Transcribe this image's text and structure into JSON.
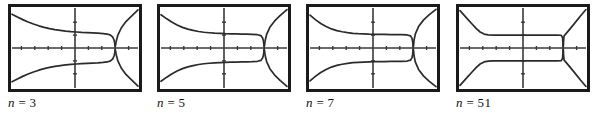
{
  "figure": {
    "caption_style": "italic-serif",
    "colors": {
      "frame": "#1a1a1a",
      "curve": "#2b2b2b",
      "axis": "#3a3a3a",
      "background": "#ffffff"
    },
    "panels": [
      {
        "id": "panel-n-3",
        "label_var": "n",
        "label_eq": "=",
        "label_value": "3",
        "label_text": "n = 3"
      },
      {
        "id": "panel-n-5",
        "label_var": "n",
        "label_eq": "=",
        "label_value": "5",
        "label_text": "n = 5"
      },
      {
        "id": "panel-n-7",
        "label_var": "n",
        "label_eq": "=",
        "label_value": "7",
        "label_text": "n = 7"
      },
      {
        "id": "panel-n-51",
        "label_var": "n",
        "label_eq": "=",
        "label_value": "51",
        "label_text": "n = 51"
      }
    ]
  },
  "chart_data": [
    {
      "type": "line",
      "title": "n = 3",
      "xlabel": "",
      "ylabel": "",
      "xlim": [
        -4.7,
        4.7
      ],
      "ylim": [
        -3.1,
        3.1
      ],
      "grid": false,
      "legend": false,
      "x_ticks": [
        -4,
        -3,
        -2,
        -1,
        1,
        2,
        3,
        4
      ],
      "y_ticks": [
        -2,
        -1,
        1,
        2
      ],
      "asymptote_x": 3.0,
      "series": [
        {
          "name": "upper-branch",
          "x": [
            -4.7,
            -4.3,
            -3.9,
            -3.5,
            -3.1,
            -2.7,
            -2.3,
            -1.9,
            -1.5,
            -1.1,
            -0.7,
            -0.3,
            0.1,
            0.5,
            0.9,
            1.3,
            1.7,
            2.1,
            2.4,
            2.65,
            2.82,
            2.92,
            2.97,
            2.99
          ],
          "y": [
            2.62,
            2.4,
            2.2,
            2.02,
            1.86,
            1.72,
            1.6,
            1.5,
            1.42,
            1.36,
            1.31,
            1.27,
            1.24,
            1.21,
            1.19,
            1.17,
            1.15,
            1.12,
            1.08,
            1.0,
            0.84,
            0.6,
            0.34,
            0.12
          ]
        },
        {
          "name": "lower-branch",
          "x": [
            -4.7,
            -4.3,
            -3.9,
            -3.5,
            -3.1,
            -2.7,
            -2.3,
            -1.9,
            -1.5,
            -1.1,
            -0.7,
            -0.3,
            0.1,
            0.5,
            0.9,
            1.3,
            1.7,
            2.1,
            2.4,
            2.65,
            2.82,
            2.92,
            2.97,
            2.99
          ],
          "y": [
            -2.62,
            -2.4,
            -2.2,
            -2.02,
            -1.86,
            -1.72,
            -1.6,
            -1.5,
            -1.42,
            -1.36,
            -1.31,
            -1.27,
            -1.24,
            -1.21,
            -1.19,
            -1.17,
            -1.15,
            -1.12,
            -1.08,
            -1.0,
            -0.84,
            -0.6,
            -0.34,
            -0.12
          ]
        },
        {
          "name": "right-upper-tail",
          "x": [
            3.02,
            3.08,
            3.2,
            3.45,
            3.8,
            4.2,
            4.7
          ],
          "y": [
            0.18,
            0.55,
            1.0,
            1.55,
            2.05,
            2.45,
            2.95
          ]
        },
        {
          "name": "right-lower-tail",
          "x": [
            3.02,
            3.08,
            3.2,
            3.45,
            3.8,
            4.2,
            4.7
          ],
          "y": [
            -0.18,
            -0.55,
            -1.0,
            -1.55,
            -2.05,
            -2.45,
            -2.95
          ]
        }
      ]
    },
    {
      "type": "line",
      "title": "n = 5",
      "xlabel": "",
      "ylabel": "",
      "xlim": [
        -4.7,
        4.7
      ],
      "ylim": [
        -3.1,
        3.1
      ],
      "grid": false,
      "legend": false,
      "x_ticks": [
        -4,
        -3,
        -2,
        -1,
        1,
        2,
        3,
        4
      ],
      "y_ticks": [
        -2,
        -1,
        1,
        2
      ],
      "asymptote_x": 3.0,
      "series": [
        {
          "name": "upper-branch",
          "x": [
            -4.7,
            -4.3,
            -3.9,
            -3.5,
            -3.1,
            -2.7,
            -2.3,
            -1.9,
            -1.5,
            -1.1,
            -0.7,
            -0.3,
            0.1,
            0.5,
            0.9,
            1.3,
            1.7,
            2.1,
            2.5,
            2.75,
            2.88,
            2.94,
            2.97,
            2.99
          ],
          "y": [
            2.58,
            2.28,
            2.01,
            1.78,
            1.6,
            1.46,
            1.36,
            1.28,
            1.22,
            1.18,
            1.15,
            1.13,
            1.11,
            1.1,
            1.09,
            1.08,
            1.07,
            1.06,
            1.03,
            0.96,
            0.78,
            0.55,
            0.32,
            0.11
          ]
        },
        {
          "name": "lower-branch",
          "x": [
            -4.7,
            -4.3,
            -3.9,
            -3.5,
            -3.1,
            -2.7,
            -2.3,
            -1.9,
            -1.5,
            -1.1,
            -0.7,
            -0.3,
            0.1,
            0.5,
            0.9,
            1.3,
            1.7,
            2.1,
            2.5,
            2.75,
            2.88,
            2.94,
            2.97,
            2.99
          ],
          "y": [
            -2.58,
            -2.28,
            -2.01,
            -1.78,
            -1.6,
            -1.46,
            -1.36,
            -1.28,
            -1.22,
            -1.18,
            -1.15,
            -1.13,
            -1.11,
            -1.1,
            -1.09,
            -1.08,
            -1.07,
            -1.06,
            -1.03,
            -0.96,
            -0.78,
            -0.55,
            -0.32,
            -0.11
          ]
        },
        {
          "name": "right-upper-tail",
          "x": [
            3.02,
            3.07,
            3.18,
            3.42,
            3.78,
            4.2,
            4.7
          ],
          "y": [
            0.16,
            0.58,
            1.05,
            1.6,
            2.1,
            2.52,
            2.98
          ]
        },
        {
          "name": "right-lower-tail",
          "x": [
            3.02,
            3.07,
            3.18,
            3.42,
            3.78,
            4.2,
            4.7
          ],
          "y": [
            -0.16,
            -0.58,
            -1.05,
            -1.6,
            -2.1,
            -2.52,
            -2.98
          ]
        }
      ]
    },
    {
      "type": "line",
      "title": "n = 7",
      "xlabel": "",
      "ylabel": "",
      "xlim": [
        -4.7,
        4.7
      ],
      "ylim": [
        -3.1,
        3.1
      ],
      "grid": false,
      "legend": false,
      "x_ticks": [
        -4,
        -3,
        -2,
        -1,
        1,
        2,
        3,
        4
      ],
      "y_ticks": [
        -2,
        -1,
        1,
        2
      ],
      "asymptote_x": 3.0,
      "series": [
        {
          "name": "upper-branch",
          "x": [
            -4.7,
            -4.3,
            -3.9,
            -3.5,
            -3.1,
            -2.7,
            -2.3,
            -1.9,
            -1.5,
            -1.1,
            -0.7,
            -0.3,
            0.1,
            0.5,
            0.9,
            1.3,
            1.7,
            2.1,
            2.55,
            2.8,
            2.91,
            2.96,
            2.98,
            2.99
          ],
          "y": [
            2.55,
            2.2,
            1.9,
            1.67,
            1.48,
            1.35,
            1.26,
            1.19,
            1.14,
            1.11,
            1.09,
            1.07,
            1.06,
            1.05,
            1.05,
            1.04,
            1.04,
            1.03,
            1.01,
            0.94,
            0.74,
            0.5,
            0.28,
            0.1
          ]
        },
        {
          "name": "lower-branch",
          "x": [
            -4.7,
            -4.3,
            -3.9,
            -3.5,
            -3.1,
            -2.7,
            -2.3,
            -1.9,
            -1.5,
            -1.1,
            -0.7,
            -0.3,
            0.1,
            0.5,
            0.9,
            1.3,
            1.7,
            2.1,
            2.55,
            2.8,
            2.91,
            2.96,
            2.98,
            2.99
          ],
          "y": [
            -2.55,
            -2.2,
            -1.9,
            -1.67,
            -1.48,
            -1.35,
            -1.26,
            -1.19,
            -1.14,
            -1.11,
            -1.09,
            -1.07,
            -1.06,
            -1.05,
            -1.05,
            -1.04,
            -1.04,
            -1.03,
            -1.01,
            -0.94,
            -0.74,
            -0.5,
            -0.28,
            -0.1
          ]
        },
        {
          "name": "right-upper-tail",
          "x": [
            3.02,
            3.06,
            3.16,
            3.4,
            3.76,
            4.2,
            4.7
          ],
          "y": [
            0.15,
            0.6,
            1.1,
            1.66,
            2.16,
            2.58,
            3.0
          ]
        },
        {
          "name": "right-lower-tail",
          "x": [
            3.02,
            3.06,
            3.16,
            3.4,
            3.76,
            4.2,
            4.7
          ],
          "y": [
            -0.15,
            -0.6,
            -1.1,
            -1.66,
            -2.16,
            -2.58,
            -3.0
          ]
        }
      ]
    },
    {
      "type": "line",
      "title": "n = 51",
      "xlabel": "",
      "ylabel": "",
      "xlim": [
        -4.7,
        4.7
      ],
      "ylim": [
        -3.1,
        3.1
      ],
      "grid": false,
      "legend": false,
      "x_ticks": [
        -4,
        -3,
        -2,
        -1,
        1,
        2,
        3,
        4
      ],
      "y_ticks": [
        -2,
        -1,
        1,
        2
      ],
      "asymptote_x": 3.0,
      "series": [
        {
          "name": "upper-branch",
          "x": [
            -4.7,
            -4.4,
            -4.1,
            -3.8,
            -3.5,
            -3.2,
            -2.9,
            -2.6,
            -2.2,
            -1.6,
            -1.0,
            -0.4,
            0.2,
            0.8,
            1.4,
            2.0,
            2.5,
            2.85,
            2.95,
            2.975,
            2.99
          ],
          "y": [
            2.9,
            2.55,
            2.2,
            1.86,
            1.52,
            1.24,
            1.08,
            1.02,
            1.0,
            1.0,
            1.0,
            1.0,
            1.0,
            1.0,
            1.0,
            1.0,
            1.0,
            0.99,
            0.8,
            0.45,
            0.1
          ]
        },
        {
          "name": "lower-branch",
          "x": [
            -4.7,
            -4.4,
            -4.1,
            -3.8,
            -3.5,
            -3.2,
            -2.9,
            -2.6,
            -2.2,
            -1.6,
            -1.0,
            -0.4,
            0.2,
            0.8,
            1.4,
            2.0,
            2.5,
            2.85,
            2.95,
            2.975,
            2.99
          ],
          "y": [
            -2.9,
            -2.55,
            -2.2,
            -1.86,
            -1.52,
            -1.24,
            -1.08,
            -1.02,
            -1.0,
            -1.0,
            -1.0,
            -1.0,
            -1.0,
            -1.0,
            -1.0,
            -1.0,
            -1.0,
            -0.99,
            -0.8,
            -0.45,
            -0.1
          ]
        },
        {
          "name": "right-upper-tail",
          "x": [
            3.01,
            3.025,
            3.06,
            3.15,
            3.4,
            3.8,
            4.3,
            4.7
          ],
          "y": [
            0.12,
            0.5,
            0.92,
            1.04,
            1.35,
            1.85,
            2.5,
            2.98
          ]
        },
        {
          "name": "right-lower-tail",
          "x": [
            3.01,
            3.025,
            3.06,
            3.15,
            3.4,
            3.8,
            4.3,
            4.7
          ],
          "y": [
            -0.12,
            -0.5,
            -0.92,
            -1.04,
            -1.35,
            -1.85,
            -2.5,
            -2.98
          ]
        }
      ]
    }
  ]
}
